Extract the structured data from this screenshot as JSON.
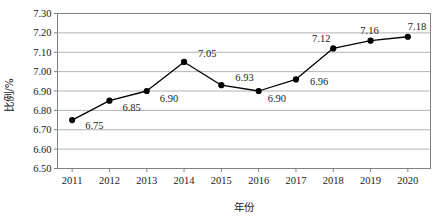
{
  "chart_data": {
    "type": "line",
    "title": "",
    "xlabel": "年份",
    "ylabel": "比例/%",
    "categories": [
      "2011",
      "2012",
      "2013",
      "2014",
      "2015",
      "2016",
      "2017",
      "2018",
      "2019",
      "2020"
    ],
    "values": [
      6.75,
      6.85,
      6.9,
      7.05,
      6.93,
      6.9,
      6.96,
      7.12,
      7.16,
      7.18
    ],
    "point_labels": [
      "6.75",
      "6.85",
      "6.90",
      "7.05",
      "6.93",
      "6.90",
      "6.96",
      "7.12",
      "7.16",
      "7.18"
    ],
    "ylim": [
      6.5,
      7.3
    ],
    "ytick_labels": [
      "7.30",
      "7.20",
      "7.10",
      "7.00",
      "6.90",
      "6.80",
      "6.70",
      "6.60",
      "6.50"
    ],
    "ytick_values": [
      7.3,
      7.2,
      7.1,
      7.0,
      6.9,
      6.8,
      6.7,
      6.6,
      6.5
    ],
    "grid": "horizontal",
    "legend": "none",
    "series_color": "#000000",
    "marker": "filled-circle",
    "gridline_color": "#b3b3b3",
    "border_color": "#808080",
    "background_color": "#ffffff"
  }
}
